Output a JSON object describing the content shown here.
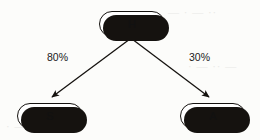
{
  "diagram": {
    "type": "tree",
    "background_color": "#fcfcfa",
    "stroke_color": "#15120f",
    "node_fill_color": "#ffffff",
    "nodes": [
      {
        "id": "H",
        "label": "H",
        "role": "root",
        "x": 99,
        "y": 11
      },
      {
        "id": "S",
        "label": "S",
        "role": "leaf",
        "x": 17,
        "y": 103
      },
      {
        "id": "A",
        "label": "A",
        "role": "leaf",
        "x": 180,
        "y": 103
      }
    ],
    "edges": [
      {
        "from": "H",
        "to": "S",
        "label": "80%",
        "direction": "down-left"
      },
      {
        "from": "H",
        "to": "A",
        "label": "30%",
        "direction": "down-right"
      }
    ]
  },
  "ghost_text": {
    "top_right": "— · — ··",
    "mid_right": "· — ·· —",
    "low_right": "·· — ·",
    "bottom_left": "· —·"
  }
}
